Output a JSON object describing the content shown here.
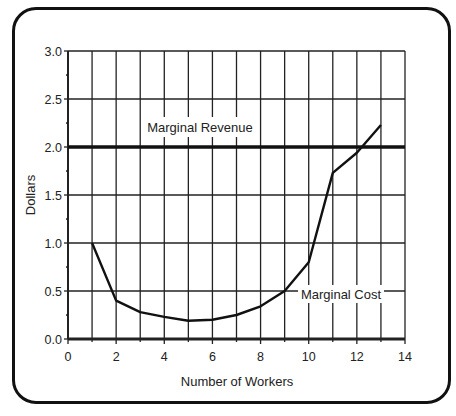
{
  "chart_data": {
    "type": "line",
    "title": "",
    "xlabel": "Number of Workers",
    "ylabel": "Dollars",
    "xlim": [
      0,
      14
    ],
    "ylim": [
      0,
      3.0
    ],
    "x_ticks": [
      "0",
      "2",
      "4",
      "6",
      "8",
      "10",
      "12",
      "14"
    ],
    "y_ticks": [
      "0.0",
      "0.5",
      "1.0",
      "1.5",
      "2.0",
      "2.5",
      "3.0"
    ],
    "grid": true,
    "legend": "inline labels",
    "series": [
      {
        "name": "Marginal Revenue",
        "x": [
          0,
          14
        ],
        "values": [
          2.0,
          2.0
        ]
      },
      {
        "name": "Marginal Cost",
        "x": [
          1,
          2,
          3,
          4,
          5,
          6,
          7,
          8,
          9,
          10,
          11,
          12,
          13
        ],
        "values": [
          1.0,
          0.4,
          0.28,
          0.23,
          0.19,
          0.2,
          0.25,
          0.34,
          0.5,
          0.8,
          1.73,
          1.94,
          2.23
        ]
      }
    ]
  },
  "labels": {
    "marginal_revenue": "Marginal Revenue",
    "marginal_cost": "Marginal Cost",
    "x_axis_title": "Number of Workers",
    "y_axis_title": "Dollars"
  },
  "colors": {
    "line": "#111111",
    "grid": "#222222",
    "background": "#ffffff"
  }
}
